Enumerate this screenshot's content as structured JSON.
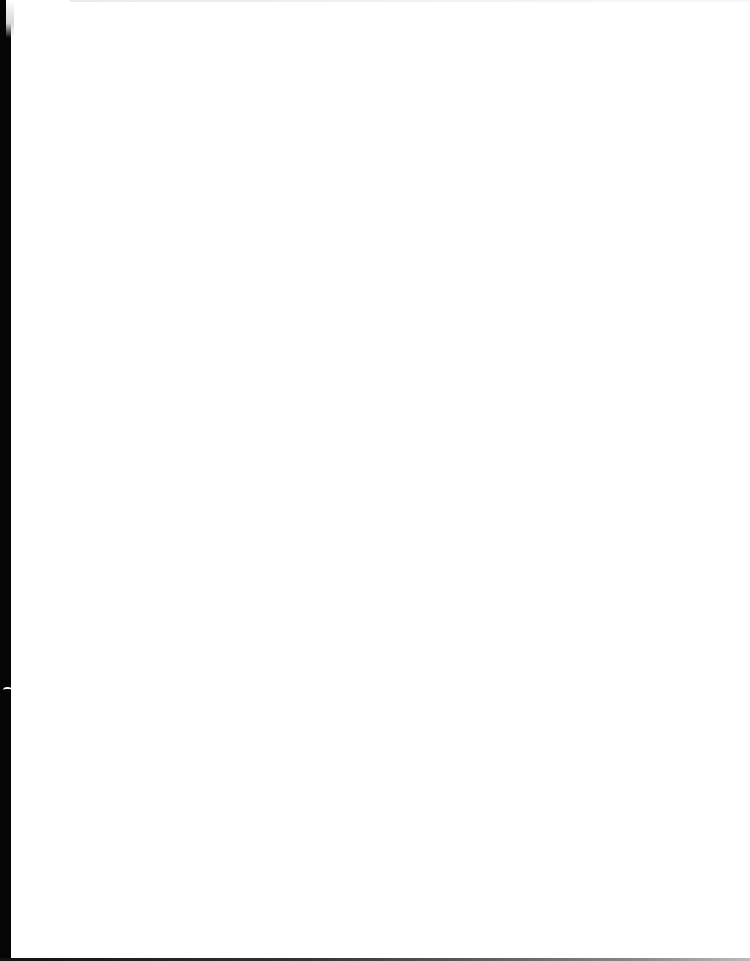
{
  "document": {
    "type": "scanned-page",
    "content": "",
    "is_blank": true
  },
  "colors": {
    "page": "#ffffff",
    "scanner_edge": "#050505"
  }
}
